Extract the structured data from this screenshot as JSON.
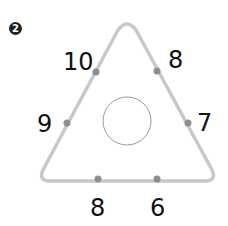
{
  "problem": {
    "badge": "2"
  },
  "triangle": {
    "stroke_color": "#c8c8c8",
    "dot_color": "#8e8e8e",
    "circle_color": "#9a9a9a",
    "center_value": "",
    "numbers": {
      "left_upper": "10",
      "right_upper": "8",
      "left_lower": "9",
      "right_lower": "7",
      "bottom_left": "8",
      "bottom_right": "6"
    }
  }
}
